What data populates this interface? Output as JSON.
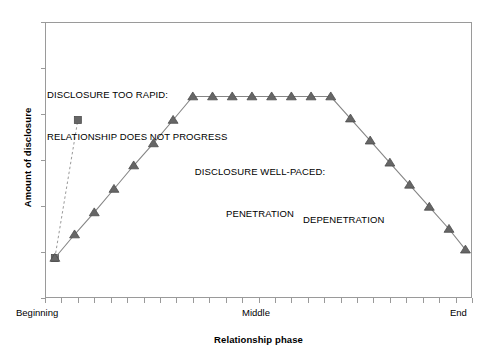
{
  "chart_data": {
    "type": "line",
    "title": "",
    "subtitle": "",
    "xlabel": "Relationship phase",
    "ylabel": "Amount of disclosure",
    "xlim": [
      0,
      26
    ],
    "ylim": [
      0,
      10
    ],
    "grid": false,
    "legend_position": "none",
    "x_tick_labels": [
      "Beginning",
      "Middle",
      "End"
    ],
    "x_tick_label_positions": [
      0,
      13,
      26
    ],
    "x_minor_tick_count": 26,
    "y_tick_count": 7,
    "y_tick_labels": [],
    "series": [
      {
        "name": "Disclosure too rapid",
        "marker": "square",
        "linestyle": "dashed",
        "color": "#666666",
        "x": [
          0.6,
          2.0
        ],
        "y": [
          1.45,
          6.45
        ]
      },
      {
        "name": "Disclosure well-paced",
        "marker": "triangle",
        "linestyle": "solid",
        "color": "#666666",
        "x": [
          0.6,
          1.8,
          3.0,
          4.2,
          5.4,
          6.6,
          7.8,
          9.0,
          10.2,
          11.4,
          12.6,
          13.8,
          15.0,
          16.2,
          17.4,
          18.6,
          19.8,
          21.0,
          22.2,
          23.4,
          24.6,
          25.6
        ],
        "y": [
          1.45,
          2.3,
          3.1,
          3.95,
          4.8,
          5.6,
          6.45,
          7.3,
          7.3,
          7.3,
          7.3,
          7.3,
          7.3,
          7.3,
          7.3,
          6.5,
          5.7,
          4.9,
          4.1,
          3.3,
          2.5,
          1.75
        ]
      }
    ],
    "annotations": [
      {
        "id": "disclosure-too-rapid",
        "line1": "DISCLOSURE TOO RAPID:",
        "line2": "RELATIONSHIP DOES NOT PROGRESS"
      },
      {
        "id": "disclosure-well-paced",
        "line1": "DISCLOSURE WELL-PACED:",
        "line2": "PENETRATION"
      },
      {
        "id": "depenetration",
        "line1": "DEPENETRATION"
      }
    ]
  },
  "axes": {
    "y_title": "Amount of disclosure",
    "x_title": "Relationship phase",
    "x_tick_beginning": "Beginning",
    "x_tick_middle": "Middle",
    "x_tick_end": "End"
  },
  "annotations": {
    "rapid_line1": "DISCLOSURE TOO RAPID:",
    "rapid_line2": "RELATIONSHIP DOES NOT PROGRESS",
    "wellpaced_line1": "DISCLOSURE WELL-PACED:",
    "wellpaced_line2": "PENETRATION",
    "depenetration": "DEPENETRATION"
  },
  "colors": {
    "marker": "#666666",
    "line": "#808080",
    "frame": "#9a9a9a",
    "text": "#000000",
    "background": "#ffffff"
  }
}
